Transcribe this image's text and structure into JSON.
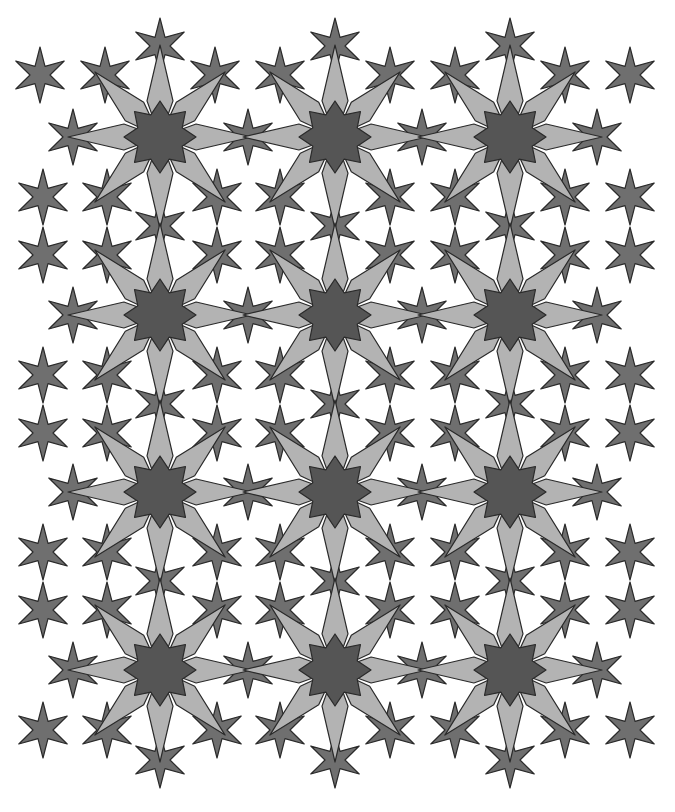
{
  "colors": {
    "background": "#ffffff",
    "stroke": "#2a2a2a",
    "six_star_fill": "#6f6f6f",
    "eight_star_core": "#555555",
    "eight_star_points": "#b3b3b3"
  },
  "eight_stars": {
    "cols": [
      160,
      335,
      510
    ],
    "rows": [
      137,
      315,
      492,
      670
    ],
    "core_outer": 36,
    "core_inner": 24,
    "point_length": 92,
    "point_half_width_angle": 9
  },
  "six_stars": {
    "outer_radius": 28,
    "inner_radius": 10,
    "positions": [
      [
        160,
        46
      ],
      [
        335,
        46
      ],
      [
        510,
        46
      ],
      [
        40,
        75
      ],
      [
        105,
        75
      ],
      [
        215,
        75
      ],
      [
        280,
        75
      ],
      [
        390,
        75
      ],
      [
        455,
        75
      ],
      [
        565,
        75
      ],
      [
        630,
        75
      ],
      [
        73,
        137
      ],
      [
        248,
        137
      ],
      [
        422,
        137
      ],
      [
        597,
        137
      ],
      [
        43,
        197
      ],
      [
        107,
        197
      ],
      [
        217,
        197
      ],
      [
        280,
        197
      ],
      [
        390,
        197
      ],
      [
        455,
        197
      ],
      [
        565,
        197
      ],
      [
        630,
        197
      ],
      [
        160,
        226
      ],
      [
        335,
        226
      ],
      [
        510,
        226
      ],
      [
        43,
        255
      ],
      [
        107,
        255
      ],
      [
        217,
        255
      ],
      [
        280,
        255
      ],
      [
        390,
        255
      ],
      [
        455,
        255
      ],
      [
        565,
        255
      ],
      [
        630,
        255
      ],
      [
        73,
        315
      ],
      [
        248,
        315
      ],
      [
        422,
        315
      ],
      [
        597,
        315
      ],
      [
        43,
        375
      ],
      [
        107,
        375
      ],
      [
        217,
        375
      ],
      [
        280,
        375
      ],
      [
        390,
        375
      ],
      [
        455,
        375
      ],
      [
        565,
        375
      ],
      [
        630,
        375
      ],
      [
        160,
        404
      ],
      [
        335,
        404
      ],
      [
        510,
        404
      ],
      [
        43,
        433
      ],
      [
        107,
        433
      ],
      [
        217,
        433
      ],
      [
        280,
        433
      ],
      [
        390,
        433
      ],
      [
        455,
        433
      ],
      [
        565,
        433
      ],
      [
        630,
        433
      ],
      [
        73,
        492
      ],
      [
        248,
        492
      ],
      [
        422,
        492
      ],
      [
        597,
        492
      ],
      [
        43,
        552
      ],
      [
        107,
        552
      ],
      [
        217,
        552
      ],
      [
        280,
        552
      ],
      [
        390,
        552
      ],
      [
        455,
        552
      ],
      [
        565,
        552
      ],
      [
        630,
        552
      ],
      [
        160,
        581
      ],
      [
        335,
        581
      ],
      [
        510,
        581
      ],
      [
        43,
        610
      ],
      [
        107,
        610
      ],
      [
        217,
        610
      ],
      [
        280,
        610
      ],
      [
        390,
        610
      ],
      [
        455,
        610
      ],
      [
        565,
        610
      ],
      [
        630,
        610
      ],
      [
        73,
        670
      ],
      [
        248,
        670
      ],
      [
        422,
        670
      ],
      [
        597,
        670
      ],
      [
        43,
        730
      ],
      [
        107,
        730
      ],
      [
        217,
        730
      ],
      [
        280,
        730
      ],
      [
        390,
        730
      ],
      [
        455,
        730
      ],
      [
        565,
        730
      ],
      [
        630,
        730
      ],
      [
        160,
        760
      ],
      [
        335,
        760
      ],
      [
        510,
        760
      ]
    ]
  }
}
